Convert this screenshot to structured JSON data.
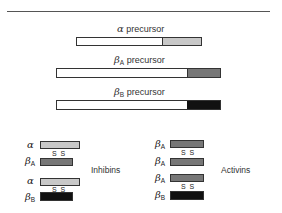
{
  "precursors": [
    {
      "greek": "α",
      "sub": "",
      "label": "precursor"
    },
    {
      "greek": "β",
      "sub": "A",
      "label": "precursor"
    },
    {
      "greek": "β",
      "sub": "B",
      "label": "precursor"
    }
  ],
  "inhibins": {
    "label": "Inhibins",
    "chains": [
      {
        "greek": "α",
        "sub": ""
      },
      {
        "greek": "β",
        "sub": "A"
      },
      {
        "greek": "α",
        "sub": ""
      },
      {
        "greek": "β",
        "sub": "B"
      }
    ],
    "bond": "S S"
  },
  "activins": {
    "label": "Activins",
    "chains": [
      {
        "greek": "β",
        "sub": "A"
      },
      {
        "greek": "β",
        "sub": "A"
      },
      {
        "greek": "β",
        "sub": "A"
      },
      {
        "greek": "β",
        "sub": "B"
      }
    ],
    "bond": "S S"
  },
  "colors": {
    "alpha": "#c8c8c8",
    "beta_A": "#777777",
    "beta_B": "#111111",
    "prodomain": "#ffffff"
  }
}
